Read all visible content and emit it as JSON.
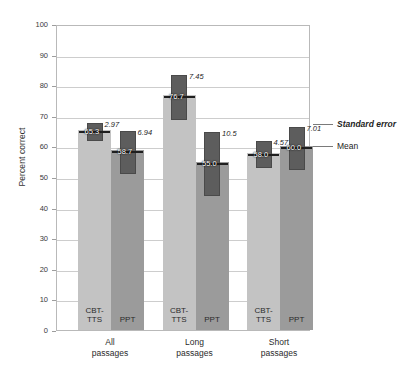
{
  "chart_data": {
    "type": "bar",
    "title": "",
    "xlabel": "",
    "ylabel": "Percent correct",
    "ylim": [
      0,
      100
    ],
    "ytick_step": 10,
    "yticks": [
      0,
      10,
      20,
      30,
      40,
      50,
      60,
      70,
      80,
      90,
      100
    ],
    "grid": true,
    "categories": [
      "All passages",
      "Long passages",
      "Short passages"
    ],
    "series": [
      {
        "name": "CBT-TTS",
        "values": [
          65.3,
          76.7,
          58.0
        ],
        "errors": [
          2.97,
          7.45,
          4.57
        ],
        "color": "#c3c3c3"
      },
      {
        "name": "PPT",
        "values": [
          58.7,
          55.0,
          60.0
        ],
        "errors": [
          6.94,
          10.5,
          7.01
        ],
        "color": "#9b9b9b"
      }
    ],
    "legend": {
      "position": "right",
      "entries": [
        "Standard error",
        "Mean"
      ]
    },
    "annotations": [
      "Error blocks show mean plus/minus one standard error",
      "Mean marker is the horizontal black tick on each bar"
    ]
  },
  "axis": {
    "y_title": "Percent correct",
    "tick_labels": [
      "100",
      "90",
      "80",
      "70",
      "60",
      "50",
      "40",
      "30",
      "20",
      "10",
      "0"
    ]
  },
  "groups": [
    {
      "line1": "All",
      "line2": "passages",
      "bars": [
        {
          "series": "CBT-TTS",
          "inner_line1": "CBT-",
          "inner_line2": "TTS",
          "mean": "65.3",
          "error": "2.97"
        },
        {
          "series": "PPT",
          "inner_line1": "PPT",
          "inner_line2": "",
          "mean": "58.7",
          "error": "6.94"
        }
      ]
    },
    {
      "line1": "Long",
      "line2": "passages",
      "bars": [
        {
          "series": "CBT-TTS",
          "inner_line1": "CBT-",
          "inner_line2": "TTS",
          "mean": "76.7",
          "error": "7.45"
        },
        {
          "series": "PPT",
          "inner_line1": "PPT",
          "inner_line2": "",
          "mean": "55.0",
          "error": "10.5"
        }
      ]
    },
    {
      "line1": "Short",
      "line2": "passages",
      "bars": [
        {
          "series": "CBT-TTS",
          "inner_line1": "CBT-",
          "inner_line2": "TTS",
          "mean": "58.0",
          "error": "4.57"
        },
        {
          "series": "PPT",
          "inner_line1": "PPT",
          "inner_line2": "",
          "mean": "60.0",
          "error": "7.01"
        }
      ]
    }
  ],
  "legend": {
    "standard_error": "Standard error",
    "mean": "Mean"
  },
  "colors": {
    "bar_cbt": "#c3c3c3",
    "bar_ppt": "#9b9b9b",
    "error_block": "#5d5d5d",
    "grid": "#cdcdcd",
    "frame": "#b9b9b9"
  }
}
